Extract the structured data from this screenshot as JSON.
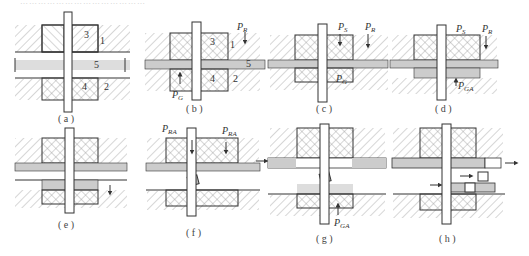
{
  "figure": {
    "top_caption_partial": "……………………………………",
    "panels": [
      {
        "id": "a",
        "caption": "( a )",
        "labels": [
          "1",
          "2",
          "3",
          "4",
          "5"
        ]
      },
      {
        "id": "b",
        "caption": "( b )",
        "labels": [
          "1",
          "2",
          "3",
          "4",
          "5"
        ],
        "forces": [
          {
            "main": "P",
            "sub": "R"
          },
          {
            "main": "P",
            "sub": "G"
          }
        ]
      },
      {
        "id": "c",
        "caption": "( c )",
        "forces": [
          {
            "main": "P",
            "sub": "S"
          },
          {
            "main": "P",
            "sub": "R"
          },
          {
            "main": "P",
            "sub": "G"
          }
        ]
      },
      {
        "id": "d",
        "caption": "( d )",
        "forces": [
          {
            "main": "P",
            "sub": "S"
          },
          {
            "main": "P",
            "sub": "R"
          },
          {
            "main": "P",
            "sub": "GA"
          }
        ]
      },
      {
        "id": "e",
        "caption": "( e )"
      },
      {
        "id": "f",
        "caption": "( f )",
        "forces": [
          {
            "main": "P",
            "sub": "RA"
          },
          {
            "main": "P",
            "sub": "RA"
          }
        ]
      },
      {
        "id": "g",
        "caption": "( g )",
        "forces": [
          {
            "main": "P",
            "sub": "GA"
          }
        ]
      },
      {
        "id": "h",
        "caption": "( h )"
      }
    ]
  }
}
